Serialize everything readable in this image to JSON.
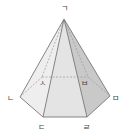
{
  "diagram": {
    "type": "hexagonal-pyramid",
    "colors": {
      "face_left": "#ececec",
      "face_front": "#e6e6e6",
      "face_right": "#d2d2d2",
      "face_far_right": "#c4c4c4",
      "face_far_left": "#f2f2f2",
      "edge": "#777777",
      "hidden_edge": "#888888",
      "label": "#444444"
    },
    "labels": {
      "apex": "ㄱ",
      "front_left": "ㄴ",
      "front_bottom_left": "ㄷ",
      "front_bottom_right": "ㄹ",
      "front_right": "ㅁ",
      "back_right": "ㅂ",
      "back_left": "ㅅ"
    }
  }
}
